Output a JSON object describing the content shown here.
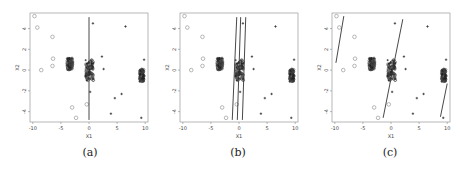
{
  "chart_data": [
    {
      "id": "a",
      "type": "scatter",
      "caption": "(a)",
      "xlabel": "X1",
      "ylabel": "X2",
      "xlim": [
        -10.5,
        10.5
      ],
      "ylim": [
        -5,
        5.5
      ],
      "xticks": [
        -10,
        -5,
        0,
        5,
        10
      ],
      "yticks": [
        -4,
        -2,
        0,
        2,
        4
      ],
      "grid": false,
      "series": [
        {
          "name": "class-circle",
          "marker": "o",
          "points": [
            [
              -9.7,
              5.2
            ],
            [
              -9.2,
              4.1
            ],
            [
              -6.5,
              3.2
            ],
            [
              -6.4,
              1.1
            ],
            [
              -6.5,
              0.4
            ],
            [
              -8.5,
              0
            ],
            [
              -3,
              -3.6
            ],
            [
              -2.3,
              -4.6
            ],
            [
              -0.4,
              -3.3
            ]
          ]
        },
        {
          "name": "class-plus",
          "marker": "+",
          "points": [
            [
              0.7,
              4.5
            ],
            [
              6.5,
              4.2
            ],
            [
              2.3,
              1.3
            ],
            [
              2.6,
              0.1
            ],
            [
              9.8,
              1
            ],
            [
              0.2,
              -2.1
            ],
            [
              5.8,
              -2.3
            ],
            [
              4.6,
              -2.7
            ],
            [
              3.9,
              -4.2
            ],
            [
              9.3,
              -4.6
            ]
          ]
        },
        {
          "name": "cluster-left",
          "marker": "dense",
          "center": [
            -3.4,
            0.6
          ],
          "spread": [
            0.5,
            0.6
          ]
        },
        {
          "name": "cluster-center",
          "marker": "dense",
          "center": [
            0.1,
            0.0
          ],
          "spread": [
            0.7,
            1.0
          ]
        },
        {
          "name": "cluster-right",
          "marker": "dense",
          "center": [
            9.4,
            -0.5
          ],
          "spread": [
            0.4,
            0.6
          ]
        }
      ],
      "lines": [
        [
          [
            0,
            5.1
          ],
          [
            0,
            -4.8
          ]
        ]
      ]
    },
    {
      "id": "b",
      "type": "scatter",
      "caption": "(b)",
      "xlabel": "X1",
      "ylabel": "X2",
      "xlim": [
        -10.5,
        10.5
      ],
      "ylim": [
        -5,
        5.5
      ],
      "xticks": [
        -10,
        -5,
        0,
        5,
        10
      ],
      "yticks": [
        -4,
        -2,
        0,
        2,
        4
      ],
      "grid": false,
      "series": "same as (a)",
      "lines": [
        [
          [
            -0.4,
            5.1
          ],
          [
            -1.2,
            -4.8
          ]
        ],
        [
          [
            0.3,
            5.1
          ],
          [
            -0.3,
            -4.8
          ]
        ],
        [
          [
            1.2,
            5.1
          ],
          [
            0.6,
            -4.8
          ]
        ]
      ]
    },
    {
      "id": "c",
      "type": "scatter",
      "caption": "(c)",
      "xlabel": "X1",
      "ylabel": "X2",
      "xlim": [
        -10.5,
        10.5
      ],
      "ylim": [
        -5,
        5.5
      ],
      "xticks": [
        -10,
        -5,
        0,
        5,
        10
      ],
      "yticks": [
        -4,
        -2,
        0,
        2,
        4
      ],
      "grid": false,
      "series": "same as (a)",
      "lines": [
        [
          [
            -8.4,
            5.2
          ],
          [
            -9.8,
            0.7
          ]
        ],
        [
          [
            2.1,
            4.9
          ],
          [
            -1.4,
            -4.6
          ]
        ],
        [
          [
            10,
            -1.3
          ],
          [
            8.8,
            -4.5
          ]
        ]
      ]
    }
  ],
  "panels": [
    {
      "caption": "(a)",
      "xlabel": "X1",
      "ylabel": "X2"
    },
    {
      "caption": "(b)",
      "xlabel": "X1",
      "ylabel": "X2"
    },
    {
      "caption": "(c)",
      "xlabel": "X1",
      "ylabel": "X2"
    }
  ],
  "ticks": {
    "x": [
      "-10",
      "-5",
      "0",
      "5",
      "10"
    ],
    "y": [
      "4",
      "2",
      "0",
      "-2",
      "-4"
    ]
  }
}
